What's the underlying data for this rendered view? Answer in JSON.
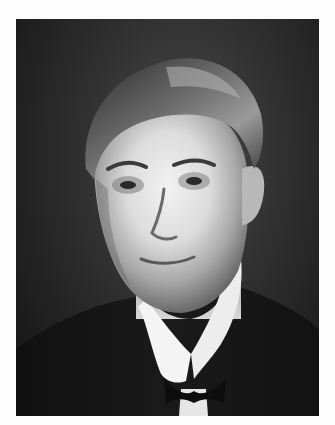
{
  "image": {
    "type": "black-and-white portrait photograph",
    "subject": "man with slicked-back hair wearing dark suit, white wing collar and bow tie",
    "colors": {
      "border": "#fdfdfd",
      "background_dark": "#1c1c1c",
      "background_mid": "#3a3a3a",
      "skin_highlight": "#ececec",
      "skin_shadow": "#8a8a8a",
      "hair": "#3b3b3b",
      "suit": "#151515",
      "collar": "#f4f4f4"
    }
  }
}
